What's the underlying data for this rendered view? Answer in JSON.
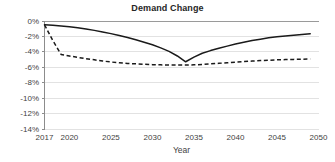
{
  "chart_data": {
    "type": "line",
    "title": "Demand Change",
    "xlabel": "Year",
    "ylabel": "",
    "xlim": [
      2017,
      2050
    ],
    "ylim": [
      -14,
      0
    ],
    "grid": true,
    "legend": "none",
    "x_ticks": [
      "2017",
      "2020",
      "2025",
      "2030",
      "2035",
      "2040",
      "2045",
      "2050"
    ],
    "x_tick_values": [
      2017,
      2020,
      2025,
      2030,
      2035,
      2040,
      2045,
      2050
    ],
    "y_ticks": [
      "0%",
      "-2%",
      "-4%",
      "-6%",
      "-8%",
      "-10%",
      "-12%",
      "-14%"
    ],
    "y_tick_values": [
      0,
      -2,
      -4,
      -6,
      -8,
      -10,
      -12,
      -14
    ],
    "series": [
      {
        "name": "solid-series",
        "style": "solid",
        "color": "#1a1a1a",
        "x": [
          2017,
          2018,
          2019,
          2020,
          2021,
          2022,
          2023,
          2024,
          2025,
          2026,
          2027,
          2028,
          2029,
          2030,
          2031,
          2032,
          2033,
          2034,
          2035,
          2036,
          2037,
          2038,
          2039,
          2040,
          2041,
          2042,
          2043,
          2044,
          2045,
          2046,
          2047,
          2048,
          2049
        ],
        "values": [
          -0.55,
          -0.6,
          -0.7,
          -0.82,
          -0.95,
          -1.1,
          -1.28,
          -1.48,
          -1.7,
          -1.95,
          -2.2,
          -2.5,
          -2.82,
          -3.15,
          -3.55,
          -4.0,
          -4.6,
          -5.35,
          -4.75,
          -4.25,
          -3.9,
          -3.6,
          -3.32,
          -3.05,
          -2.82,
          -2.6,
          -2.42,
          -2.25,
          -2.12,
          -2.0,
          -1.9,
          -1.8,
          -1.72
        ]
      },
      {
        "name": "dashed-series",
        "style": "dashed",
        "color": "#1a1a1a",
        "x": [
          2017,
          2018,
          2019,
          2020,
          2021,
          2022,
          2023,
          2024,
          2025,
          2026,
          2027,
          2028,
          2029,
          2030,
          2031,
          2032,
          2033,
          2034,
          2035,
          2036,
          2037,
          2038,
          2039,
          2040,
          2041,
          2042,
          2043,
          2044,
          2045,
          2046,
          2047,
          2048,
          2049
        ],
        "values": [
          -0.55,
          -2.6,
          -4.4,
          -4.6,
          -4.78,
          -4.95,
          -5.1,
          -5.25,
          -5.38,
          -5.48,
          -5.56,
          -5.62,
          -5.68,
          -5.72,
          -5.75,
          -5.77,
          -5.78,
          -5.78,
          -5.75,
          -5.7,
          -5.62,
          -5.55,
          -5.48,
          -5.4,
          -5.33,
          -5.26,
          -5.2,
          -5.15,
          -5.1,
          -5.07,
          -5.04,
          -5.02,
          -5.0
        ]
      }
    ]
  }
}
